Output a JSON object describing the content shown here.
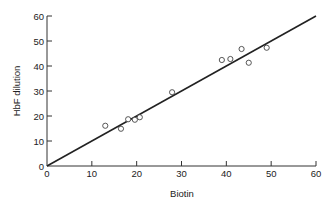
{
  "chart_data": {
    "type": "scatter",
    "title": "",
    "xlabel": "Biotin",
    "ylabel": "HbF dilution",
    "xlim": [
      0,
      60
    ],
    "ylim": [
      0,
      60
    ],
    "xticks": [
      0,
      10,
      20,
      30,
      40,
      50,
      60
    ],
    "yticks": [
      0,
      10,
      20,
      30,
      40,
      50,
      60
    ],
    "grid": false,
    "legend": null,
    "series": [
      {
        "name": "samples",
        "marker": "open-circle",
        "points": [
          {
            "x": 13.0,
            "y": 16.1
          },
          {
            "x": 16.5,
            "y": 14.9
          },
          {
            "x": 18.1,
            "y": 18.7
          },
          {
            "x": 19.6,
            "y": 18.5
          },
          {
            "x": 20.7,
            "y": 19.5
          },
          {
            "x": 27.9,
            "y": 29.5
          },
          {
            "x": 39.0,
            "y": 42.4
          },
          {
            "x": 40.9,
            "y": 42.8
          },
          {
            "x": 43.4,
            "y": 46.8
          },
          {
            "x": 45.0,
            "y": 41.3
          },
          {
            "x": 49.0,
            "y": 47.3
          }
        ]
      }
    ],
    "fit_line": {
      "x0": 0,
      "y0": 0,
      "x1": 60,
      "y1": 60
    }
  },
  "colors": {
    "axis": "#333333",
    "line": "#222222",
    "marker_stroke": "#444444",
    "background": "#ffffff"
  }
}
